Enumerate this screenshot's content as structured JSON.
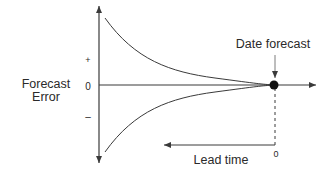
{
  "diagram": {
    "y_axis": {
      "label_line1": "Forecast",
      "label_line2": "Error",
      "ticks": {
        "plus": "+",
        "zero": "0",
        "minus": "–"
      }
    },
    "x_axis": {
      "lead_time_label": "Lead time",
      "zero_label": "0"
    },
    "annotation": {
      "date_forecast": "Date forecast"
    },
    "colors": {
      "line": "#3a3a3a",
      "text": "#2a2a2a",
      "dot": "#111111"
    }
  }
}
